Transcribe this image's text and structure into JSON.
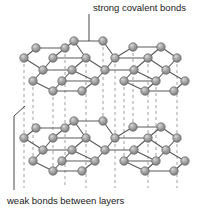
{
  "figure": {
    "background_color": "#ffffff"
  },
  "annotations": {
    "top_label": "strong covalent bonds",
    "bottom_label": "weak bonds between layers"
  },
  "style": {
    "atom_fill": "#9a9a9a",
    "atom_fill_light": "#c9c9c9",
    "atom_edge": "#4a4a4a",
    "bond_color": "#5a5a5a",
    "dashed_bond_color": "#9a9a9a",
    "leader_color": "#333333",
    "text_color": "#1a1a1a"
  },
  "structure": {
    "layers": [
      {
        "name": "upper-layer",
        "atoms": [
          {
            "x": 74,
            "y": 41
          },
          {
            "x": 103,
            "y": 41
          },
          {
            "x": 133,
            "y": 47
          },
          {
            "x": 161,
            "y": 47
          },
          {
            "x": 36,
            "y": 48
          },
          {
            "x": 65,
            "y": 48
          },
          {
            "x": 24,
            "y": 58
          },
          {
            "x": 53,
            "y": 58
          },
          {
            "x": 86,
            "y": 58
          },
          {
            "x": 115,
            "y": 58
          },
          {
            "x": 148,
            "y": 58
          },
          {
            "x": 177,
            "y": 58
          },
          {
            "x": 43,
            "y": 70
          },
          {
            "x": 72,
            "y": 70
          },
          {
            "x": 105,
            "y": 70
          },
          {
            "x": 134,
            "y": 70
          },
          {
            "x": 166,
            "y": 70
          },
          {
            "x": 33,
            "y": 81
          },
          {
            "x": 62,
            "y": 81
          },
          {
            "x": 95,
            "y": 81
          },
          {
            "x": 124,
            "y": 81
          },
          {
            "x": 156,
            "y": 81
          },
          {
            "x": 185,
            "y": 81
          },
          {
            "x": 53,
            "y": 91
          },
          {
            "x": 82,
            "y": 91
          },
          {
            "x": 145,
            "y": 91
          },
          {
            "x": 174,
            "y": 91
          }
        ]
      },
      {
        "name": "lower-layer",
        "atoms": [
          {
            "x": 74,
            "y": 121
          },
          {
            "x": 103,
            "y": 121
          },
          {
            "x": 133,
            "y": 127
          },
          {
            "x": 161,
            "y": 127
          },
          {
            "x": 36,
            "y": 128
          },
          {
            "x": 65,
            "y": 128
          },
          {
            "x": 24,
            "y": 138
          },
          {
            "x": 53,
            "y": 138
          },
          {
            "x": 86,
            "y": 138
          },
          {
            "x": 115,
            "y": 138
          },
          {
            "x": 148,
            "y": 138
          },
          {
            "x": 177,
            "y": 138
          },
          {
            "x": 43,
            "y": 150
          },
          {
            "x": 72,
            "y": 150
          },
          {
            "x": 105,
            "y": 150
          },
          {
            "x": 134,
            "y": 150
          },
          {
            "x": 166,
            "y": 150
          },
          {
            "x": 33,
            "y": 161
          },
          {
            "x": 62,
            "y": 161
          },
          {
            "x": 95,
            "y": 161
          },
          {
            "x": 124,
            "y": 161
          },
          {
            "x": 156,
            "y": 161
          },
          {
            "x": 185,
            "y": 161
          },
          {
            "x": 53,
            "y": 171
          },
          {
            "x": 82,
            "y": 171
          },
          {
            "x": 145,
            "y": 171
          },
          {
            "x": 174,
            "y": 171
          }
        ]
      }
    ],
    "interlayer_dashed_columns": [
      {
        "x": 24
      },
      {
        "x": 65
      },
      {
        "x": 86
      },
      {
        "x": 115
      },
      {
        "x": 148
      },
      {
        "x": 177
      }
    ]
  }
}
